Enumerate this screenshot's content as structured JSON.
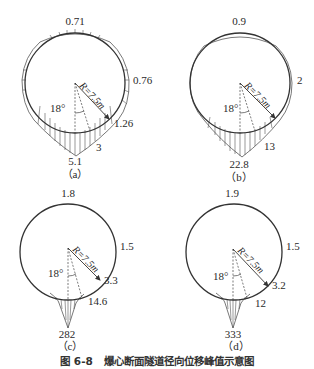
{
  "figure": {
    "caption": "图 6-8   爆心断面隧道径向位移峰值示意图",
    "radius_label": "R=7.5m",
    "angle_label": "18°",
    "colors": {
      "line": "#333333",
      "text": "#2a2a2a",
      "background": "#ffffff"
    }
  },
  "panels": [
    {
      "id": "a",
      "sub_label": "（a）",
      "values": {
        "top": "0.71",
        "right": "0.76",
        "lower_right": "1.26",
        "bottom_right": "3",
        "bottom": "5.1"
      }
    },
    {
      "id": "b",
      "sub_label": "（b）",
      "values": {
        "top": "0.9",
        "right": "2",
        "lower_right": "",
        "bottom_right": "13",
        "bottom": "22.8"
      }
    },
    {
      "id": "c",
      "sub_label": "（c）",
      "values": {
        "top": "1.8",
        "right": "1.5",
        "lower_right": "3.3",
        "bottom_right": "14.6",
        "bottom": "282"
      }
    },
    {
      "id": "d",
      "sub_label": "（d）",
      "values": {
        "top": "1.9",
        "right": "1.5",
        "lower_right": "3.2",
        "bottom_right": "12",
        "bottom": "333"
      }
    }
  ]
}
